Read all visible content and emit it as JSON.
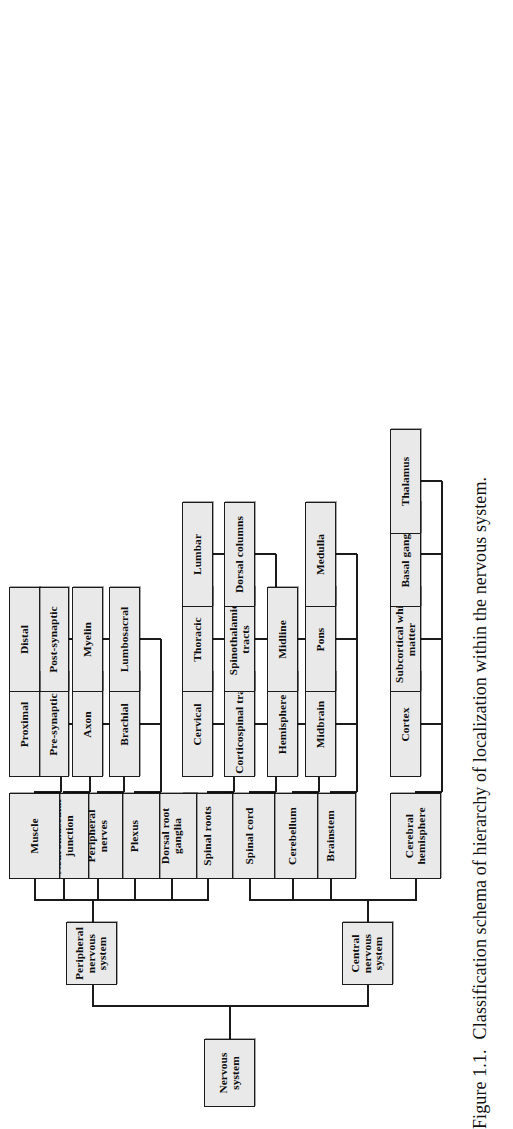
{
  "figure": {
    "number": "Figure 1.1.",
    "caption": "Classification schema of hierarchy of localization within the nervous system.",
    "full_caption": "Figure 1.1.  Classification schema of hierarchy of localization within the nervous system."
  },
  "style": {
    "box_fill": "#e9e9e9",
    "box_border": "#1b1b1b",
    "page_background": "#ffffff",
    "text_color": "#0d0d0d"
  },
  "diagram": {
    "type": "hierarchy-tree",
    "orientation": "rotated-90-ccw",
    "root": "Nervous system",
    "levels": 4,
    "nodes": {
      "root": "Nervous system",
      "l1": {
        "cns": "Central nervous system",
        "pns": "Peripheral nervous system"
      },
      "l2": {
        "cerebral_hemisphere": "Cerebral hemisphere",
        "brainstem": "Brainstem",
        "cerebellum": "Cerebellum",
        "spinal_cord": "Spinal cord",
        "spinal_roots": "Spinal roots",
        "dorsal_root_ganglia": "Dorsal root ganglia",
        "plexus": "Plexus",
        "peripheral_nerves": "Peripheral nerves",
        "neuromuscular_junction": "Neuromuscular junction",
        "muscle": "Muscle"
      },
      "l3": {
        "cortex": "Cortex",
        "subcortical_white_matter": "Subcortical white matter",
        "basal_ganglia": "Basal ganglia",
        "thalamus": "Thalamus",
        "midbrain": "Midbrain",
        "pons": "Pons",
        "medulla": "Medulla",
        "hemisphere": "Hemisphere",
        "midline": "Midline",
        "corticospinal_tracts": "Corticospinal tracts",
        "spinothalamic_tracts": "Spinothalamic tracts",
        "dorsal_columns": "Dorsal columns",
        "cervical": "Cervical",
        "thoracic": "Thoracic",
        "lumbar": "Lumbar",
        "brachial": "Brachial",
        "lumbosacral": "Lumbosacral",
        "axon": "Axon",
        "myelin": "Myelin",
        "pre_synaptic": "Pre-synaptic",
        "post_synaptic": "Post-synaptic",
        "proximal": "Proximal",
        "distal": "Distal"
      }
    },
    "branches": [
      {
        "parent": "Central nervous system",
        "children": [
          {
            "name": "Cerebral hemisphere",
            "children": [
              "Cortex",
              "Subcortical white matter",
              "Basal ganglia",
              "Thalamus"
            ]
          },
          {
            "name": "Brainstem",
            "children": [
              "Midbrain",
              "Pons",
              "Medulla"
            ]
          },
          {
            "name": "Cerebellum",
            "children": [
              "Hemisphere",
              "Midline"
            ]
          },
          {
            "name": "Spinal cord",
            "children": [
              "Corticospinal tracts",
              "Spinothalamic tracts",
              "Dorsal columns"
            ]
          }
        ]
      },
      {
        "parent": "Peripheral nervous system",
        "children": [
          {
            "name": "Spinal roots",
            "children": [
              "Cervical",
              "Thoracic",
              "Lumbar"
            ]
          },
          {
            "name": "Dorsal root ganglia",
            "children": []
          },
          {
            "name": "Plexus",
            "children": [
              "Brachial",
              "Lumbosacral"
            ]
          },
          {
            "name": "Peripheral nerves",
            "children": [
              "Axon",
              "Myelin"
            ]
          },
          {
            "name": "Neuromuscular junction",
            "children": [
              "Pre-synaptic",
              "Post-synaptic"
            ]
          },
          {
            "name": "Muscle",
            "children": [
              "Proximal",
              "Distal"
            ]
          }
        ]
      }
    ]
  }
}
